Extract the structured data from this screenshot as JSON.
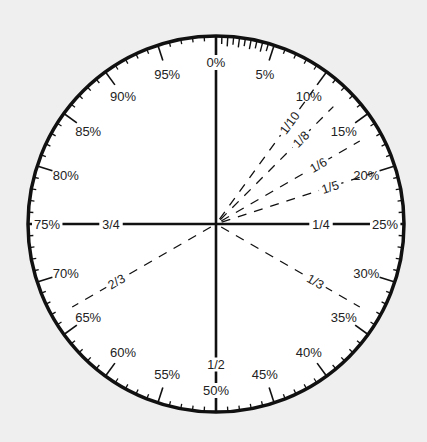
{
  "diagram": {
    "center": [
      216,
      224
    ],
    "radius": 188,
    "colors": {
      "background": "#efefef",
      "dial_fill": "#ffffff",
      "ink": "#111111",
      "text": "#222222"
    },
    "percent_labels": [
      {
        "pct": 0,
        "label": "0%"
      },
      {
        "pct": 5,
        "label": "5%"
      },
      {
        "pct": 10,
        "label": "10%"
      },
      {
        "pct": 15,
        "label": "15%"
      },
      {
        "pct": 20,
        "label": "20%"
      },
      {
        "pct": 25,
        "label": "25%"
      },
      {
        "pct": 30,
        "label": "30%"
      },
      {
        "pct": 35,
        "label": "35%"
      },
      {
        "pct": 40,
        "label": "40%"
      },
      {
        "pct": 45,
        "label": "45%"
      },
      {
        "pct": 50,
        "label": "50%"
      },
      {
        "pct": 55,
        "label": "55%"
      },
      {
        "pct": 60,
        "label": "60%"
      },
      {
        "pct": 65,
        "label": "65%"
      },
      {
        "pct": 70,
        "label": "70%"
      },
      {
        "pct": 75,
        "label": "75%"
      },
      {
        "pct": 80,
        "label": "80%"
      },
      {
        "pct": 85,
        "label": "85%"
      },
      {
        "pct": 90,
        "label": "90%"
      },
      {
        "pct": 95,
        "label": "95%"
      }
    ],
    "fraction_lines": [
      {
        "pct": 25,
        "label": "1/4",
        "style": "solid"
      },
      {
        "pct": 50,
        "label": "1/2",
        "style": "solid"
      },
      {
        "pct": 75,
        "label": "3/4",
        "style": "solid"
      },
      {
        "pct": 0,
        "label": "",
        "style": "solid"
      },
      {
        "pct": 10,
        "label": "1/10",
        "style": "dashed"
      },
      {
        "pct": 12.5,
        "label": "1/8",
        "style": "dashed"
      },
      {
        "pct": 16.67,
        "label": "1/6",
        "style": "dashed"
      },
      {
        "pct": 20,
        "label": "1/5",
        "style": "dashed"
      },
      {
        "pct": 33.33,
        "label": "1/3",
        "style": "dashed"
      },
      {
        "pct": 66.67,
        "label": "2/3",
        "style": "dashed"
      }
    ],
    "ticks": {
      "minor_step_pct": 1,
      "fine_step_pct_0_to_5": 0.5,
      "major_step_pct": 5
    }
  }
}
